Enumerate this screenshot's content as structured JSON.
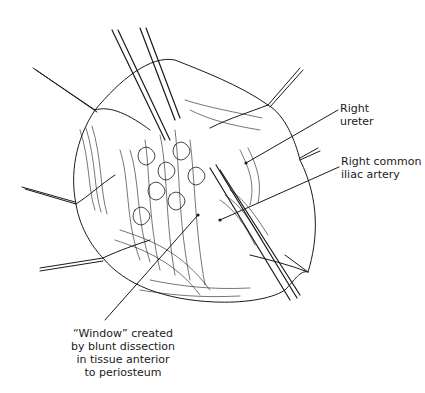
{
  "figure": {
    "type": "surgical-illustration",
    "style": "black line art on white",
    "colors": {
      "line": "#1a1a1a",
      "background": "#ffffff"
    }
  },
  "labels": {
    "ureter": {
      "lines": [
        "Right",
        "ureter"
      ],
      "leader_from": [
        338,
        110
      ],
      "leader_to": [
        246,
        163
      ]
    },
    "iliac": {
      "lines": [
        "Right common",
        "iliac artery"
      ],
      "leader_from": [
        339,
        167
      ],
      "leader_to": [
        220,
        220
      ]
    },
    "window": {
      "lines": [
        "“Window” created",
        "by blunt dissection",
        "in tissue anterior",
        "to periosteum"
      ],
      "leader_from": [
        105,
        320
      ],
      "leader_to": [
        198,
        215
      ]
    }
  }
}
